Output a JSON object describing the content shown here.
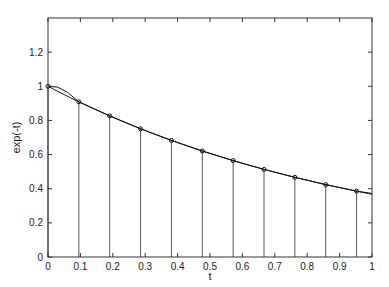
{
  "chart_data": {
    "type": "line",
    "title": "",
    "xlabel": "t",
    "ylabel": "exp(-t)",
    "xlim": [
      0,
      1
    ],
    "ylim": [
      0,
      1.4
    ],
    "grid": false,
    "legend": null,
    "xticks": [
      "0",
      "0.1",
      "0.2",
      "0.3",
      "0.4",
      "0.5",
      "0.6",
      "0.7",
      "0.8",
      "0.9",
      "1"
    ],
    "yticks": [
      "0",
      "0.2",
      "0.4",
      "0.6",
      "0.8",
      "1",
      "1.2"
    ],
    "series": [
      {
        "name": "exp(-t) stems",
        "style": "stem with circle markers",
        "x": [
          0,
          0.0952,
          0.1905,
          0.2857,
          0.381,
          0.4762,
          0.5714,
          0.6667,
          0.7619,
          0.8571,
          0.9524
        ],
        "values": [
          1.0,
          0.909,
          0.827,
          0.751,
          0.683,
          0.621,
          0.565,
          0.513,
          0.467,
          0.424,
          0.386
        ]
      },
      {
        "name": "exp(-t)",
        "style": "line",
        "x": [
          0,
          0.1,
          0.2,
          0.3,
          0.4,
          0.5,
          0.6,
          0.7,
          0.8,
          0.9,
          1.0
        ],
        "values": [
          1.0,
          0.905,
          0.819,
          0.741,
          0.67,
          0.607,
          0.549,
          0.497,
          0.449,
          0.407,
          0.368
        ]
      },
      {
        "name": "interpolant",
        "style": "line",
        "x": [
          0,
          0.03,
          0.06,
          0.0952,
          0.1905,
          0.2857,
          0.381,
          0.4762,
          0.5714,
          0.6667,
          0.7619,
          0.8571,
          0.9524,
          1.0
        ],
        "values": [
          1.0,
          0.995,
          0.965,
          0.909,
          0.827,
          0.751,
          0.683,
          0.621,
          0.565,
          0.513,
          0.467,
          0.424,
          0.386,
          0.372
        ]
      }
    ]
  }
}
